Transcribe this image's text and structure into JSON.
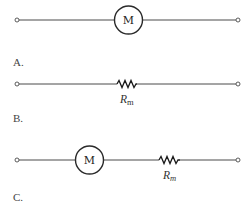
{
  "options": [
    {
      "id": "A",
      "label": "A.",
      "components": [
        "motor"
      ],
      "motor_letter": "M"
    },
    {
      "id": "B",
      "label": "B.",
      "components": [
        "resistor"
      ],
      "resistor_label": "R",
      "resistor_subscript": "m"
    },
    {
      "id": "C",
      "label": "C.",
      "components": [
        "motor",
        "resistor"
      ],
      "motor_letter": "M",
      "resistor_label": "R",
      "resistor_subscript": "m"
    }
  ],
  "colors": {
    "wire": "#4a4a4a",
    "background": "#ffffff"
  }
}
